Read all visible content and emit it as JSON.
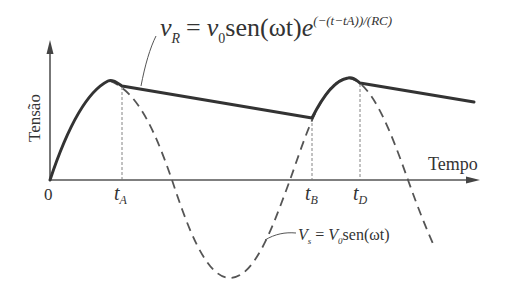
{
  "diagram": {
    "colors": {
      "axis": "#555555",
      "output_curve": "#333333",
      "source_curve": "#555555",
      "text": "#333333"
    },
    "axes": {
      "y_label": "Tensão",
      "x_label": "Tempo",
      "origin_label": "0"
    },
    "time_markers": [
      {
        "id": "tA",
        "base": "t",
        "sub": "A"
      },
      {
        "id": "tB",
        "base": "t",
        "sub": "B"
      },
      {
        "id": "tD",
        "base": "t",
        "sub": "D"
      }
    ],
    "equations": {
      "vr": {
        "lhs_base": "v",
        "lhs_sub": "R",
        "equals": "=",
        "rhs_base": "v",
        "rhs_sub": "0",
        "rhs_func": "sen(ωt)",
        "rhs_exp_base": "e",
        "rhs_exponent": "(−(t−tA))/(RC)"
      },
      "vs": {
        "lhs_base": "V",
        "lhs_sub": "s",
        "equals": "=",
        "rhs_base": "V",
        "rhs_sub": "0",
        "rhs_func": "sen(ωt)"
      }
    },
    "curves": [
      {
        "name": "output-voltage-vr",
        "style": "solid-thick",
        "description": "Rectified output: follows sine to peak, then exponential RC decay from tA to tB, recharges to tD, decays again"
      },
      {
        "name": "source-voltage-vs",
        "style": "dashed",
        "description": "Sinusoidal source voltage Vs = V0 sen(ωt)"
      }
    ]
  }
}
